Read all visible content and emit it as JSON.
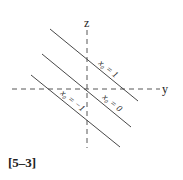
{
  "figure": {
    "caption": "[5–3]",
    "axes": {
      "vertical_label": "z",
      "horizontal_label": "y"
    },
    "lines": [
      {
        "label": "x₀ = 1"
      },
      {
        "label": "x₀ = 0"
      },
      {
        "label": "x₀ = −1"
      }
    ],
    "colors": {
      "line": "#333333",
      "axis": "#444444"
    }
  }
}
